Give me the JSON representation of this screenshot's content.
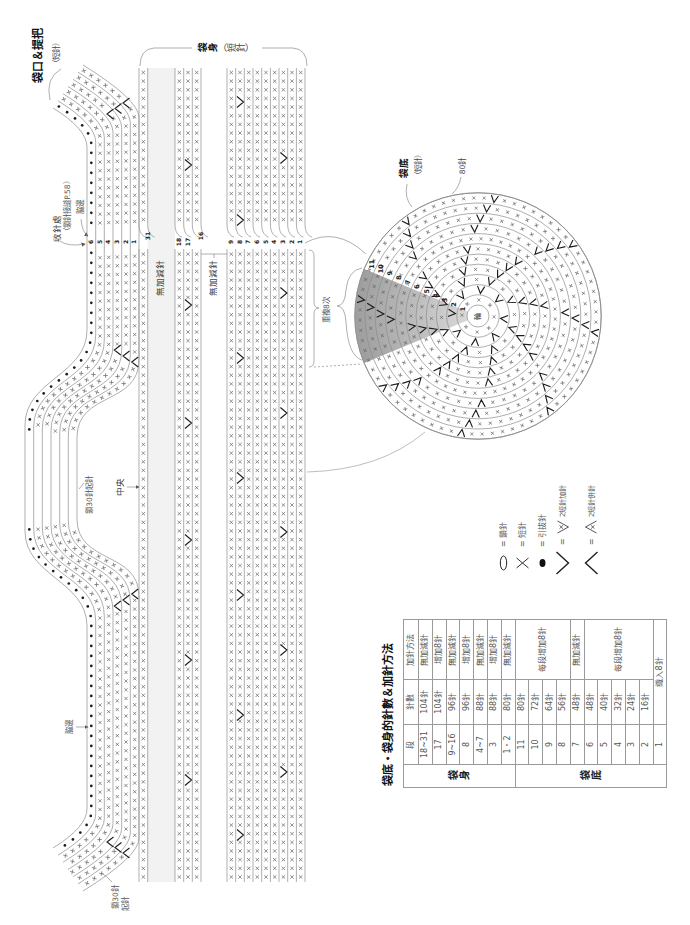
{
  "labels": {
    "mouth_handle_title": "袋口＆提把",
    "mouth_handle_sub": "（短針）",
    "body_title": "袋身",
    "body_title_sub": "（短針）",
    "finish_point": "收針處",
    "finish_note": "（鎖針接縫P.58）",
    "side_edge_top": "脇邊",
    "side_edge_bottom": "脇邊",
    "handle_chain": "鎖30針起針",
    "center_mark": "中央",
    "no_change_upper": "無加減針",
    "no_change_lower": "無加減針",
    "repeat": "重複8次",
    "bottom_title": "袋底",
    "bottom_sub": "（短針）",
    "bottom_count": "80針",
    "bottom_chain_line1": "鎖30針",
    "bottom_chain_line2": "起針",
    "ring_center": "輪"
  },
  "body_chart": {
    "handle_row_labels": [
      "6",
      "5",
      "4",
      "3",
      "2",
      "1"
    ],
    "handle_row6_stitch": "slip-stitch",
    "column_groups": [
      {
        "rows": [
          "31"
        ]
      },
      {
        "rows": [
          "18",
          "17",
          "16"
        ]
      },
      {
        "rows": [
          "9",
          "8",
          "7",
          "6",
          "5",
          "4",
          "3",
          "2",
          "1"
        ]
      }
    ],
    "increases": [
      {
        "row": "17",
        "y": [
          165,
          305,
          423,
          540,
          660,
          780
        ]
      },
      {
        "row": "8",
        "y": [
          102,
          220,
          358,
          478,
          595,
          715,
          835
        ]
      },
      {
        "row": "3",
        "y": [
          158,
          293,
          413,
          532,
          650,
          772
        ]
      }
    ],
    "handle_decreases": [
      [
        126,
        103
      ],
      [
        118,
        108.5
      ],
      [
        110,
        114
      ],
      [
        117.3,
        350
      ],
      [
        126,
        356
      ],
      [
        134.7,
        362
      ],
      [
        117.3,
        606
      ],
      [
        126,
        600
      ],
      [
        134.7,
        594
      ],
      [
        126,
        853
      ],
      [
        118,
        847.5
      ],
      [
        110,
        842
      ]
    ]
  },
  "bottom_chart": {
    "rounds": [
      {
        "round": 1,
        "stitches": 8,
        "increases": 0
      },
      {
        "round": 2,
        "stitches": 16,
        "increases": 8
      },
      {
        "round": 3,
        "stitches": 24,
        "increases": 8
      },
      {
        "round": 4,
        "stitches": 32,
        "increases": 8
      },
      {
        "round": 5,
        "stitches": 40,
        "increases": 8
      },
      {
        "round": 6,
        "stitches": 48,
        "increases": 8
      },
      {
        "round": 7,
        "stitches": 48,
        "increases": 0
      },
      {
        "round": 8,
        "stitches": 56,
        "increases": 8
      },
      {
        "round": 9,
        "stitches": 64,
        "increases": 8
      },
      {
        "round": 10,
        "stitches": 72,
        "increases": 8
      },
      {
        "round": 11,
        "stitches": 80,
        "increases": 8
      }
    ]
  },
  "legend_eq": "=",
  "legend": [
    {
      "symbol": "chain-oval",
      "label": "鎖針"
    },
    {
      "symbol": "cross",
      "label": "短針"
    },
    {
      "symbol": "dot",
      "label": "引拔針"
    },
    {
      "symbol": "v",
      "label": "2短針加針"
    },
    {
      "symbol": "inverted-v",
      "label": "2短針併針"
    }
  ],
  "table": {
    "title": "袋底・袋身的針數＆加針方法",
    "headers": {
      "round": "段",
      "count": "針數",
      "method": "加針方法"
    },
    "body_group": "袋身",
    "body_rows": [
      {
        "round": "18~31",
        "count": "104針",
        "method": "無加減針"
      },
      {
        "round": "17",
        "count": "104針",
        "method": "增加8針"
      },
      {
        "round": "9~16",
        "count": "96針",
        "method": "無加減針"
      },
      {
        "round": "8",
        "count": "96針",
        "method": "增加8針"
      },
      {
        "round": "4~7",
        "count": "88針",
        "method": "無加減針"
      },
      {
        "round": "3",
        "count": "88針",
        "method": "增加8針"
      },
      {
        "round": "1・2",
        "count": "80針",
        "method": "無加減針"
      }
    ],
    "bottom_group": "袋底",
    "bottom_rows": [
      {
        "round": "11",
        "count": "80針"
      },
      {
        "round": "10",
        "count": "72針"
      },
      {
        "round": "9",
        "count": "64針"
      },
      {
        "round": "8",
        "count": "56針"
      },
      {
        "round": "7",
        "count": "48針"
      },
      {
        "round": "6",
        "count": "48針"
      },
      {
        "round": "5",
        "count": "40針"
      },
      {
        "round": "4",
        "count": "32針"
      },
      {
        "round": "3",
        "count": "24針"
      },
      {
        "round": "2",
        "count": "16針"
      },
      {
        "round": "1",
        "count": "織入8針"
      }
    ],
    "bottom_methods": {
      "rounds_11_8": "每段增加8針",
      "round_7": "無加減針",
      "rounds_6_2": "每段增加8針"
    }
  },
  "colors": {
    "line": "#8c8c8c",
    "mark": "#6b6b6b",
    "bold_mark": "#1e1e1e",
    "gap_fill": "#f2f2f2",
    "wedge_inner": "#dedede",
    "wedge_outer": "#9e9e9e"
  }
}
